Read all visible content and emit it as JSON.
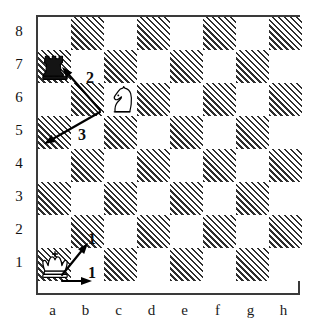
{
  "diagram": {
    "type": "chessboard",
    "orientation": "white-bottom",
    "files": [
      "a",
      "b",
      "c",
      "d",
      "e",
      "f",
      "g",
      "h"
    ],
    "ranks": [
      "8",
      "7",
      "6",
      "5",
      "4",
      "3",
      "2",
      "1"
    ],
    "colors": {
      "light_square": "#ffffff",
      "dark_square_hatch": "#2e2e2e",
      "border": "#3a3a3a",
      "arrow": "#000000",
      "label_text": "#111111"
    },
    "pieces": [
      {
        "id": "black-rook-a7",
        "piece": "rook",
        "color": "black",
        "square": "a7",
        "file": 0,
        "rank": 1
      },
      {
        "id": "white-knight-c6",
        "piece": "knight",
        "color": "white",
        "square": "c6",
        "file": 2,
        "rank": 2
      },
      {
        "id": "white-king-a1",
        "piece": "king",
        "color": "white",
        "square": "a1",
        "file": 0,
        "rank": 7
      }
    ],
    "arrows": [
      {
        "id": "arrow-c6-to-a7",
        "from": "c6",
        "to": "a7",
        "label": "2",
        "x1": 100,
        "y1": 110,
        "x2": 62,
        "y2": 67
      },
      {
        "id": "arrow-c6-to-a5",
        "from": "c6",
        "to": "a5",
        "label": "3",
        "x1": 100,
        "y1": 112,
        "x2": 44,
        "y2": 144
      },
      {
        "id": "arrow-a1-to-b2",
        "from": "a1",
        "to": "b2",
        "label": "1",
        "x1": 62,
        "y1": 275,
        "x2": 88,
        "y2": 243
      },
      {
        "id": "arrow-a1-to-b1",
        "from": "a1",
        "to": "b1",
        "label": "1",
        "x1": 62,
        "y1": 281,
        "x2": 92,
        "y2": 281
      }
    ],
    "move_labels": [
      {
        "id": "move-label-2",
        "text": "2",
        "x": 82,
        "y": 70
      },
      {
        "id": "move-label-3",
        "text": "3",
        "x": 74,
        "y": 127
      },
      {
        "id": "move-label-1-upper",
        "text": "1",
        "x": 84,
        "y": 231
      },
      {
        "id": "move-label-1-lower",
        "text": "1",
        "x": 84,
        "y": 265
      }
    ]
  }
}
